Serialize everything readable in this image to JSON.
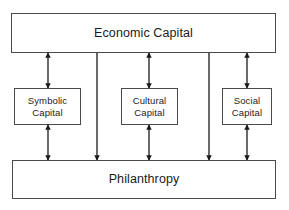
{
  "diagram": {
    "type": "block-flow-diagram",
    "width": 289,
    "height": 210,
    "background_color": "#ffffff",
    "stroke_color": "#4a4a4a",
    "arrow_color": "#1a1a1a",
    "text_color": "#1b1b1b",
    "nodes": {
      "economic_capital": {
        "label": "Economic Capital",
        "role": "top-tier"
      },
      "symbolic_capital": {
        "label": "Symbolic\nCapital",
        "role": "middle-tier"
      },
      "cultural_capital": {
        "label": "Cultural\nCapital",
        "role": "middle-tier"
      },
      "social_capital": {
        "label": "Social\nCapital",
        "role": "middle-tier"
      },
      "philanthropy": {
        "label": "Philanthropy",
        "role": "bottom-tier"
      }
    },
    "connectors": [
      {
        "name": "economic-to-symbolic",
        "from": "economic_capital",
        "to": "symbolic_capital",
        "style": "double-headed",
        "x": 48,
        "y1": 53,
        "y2": 88
      },
      {
        "name": "economic-to-cultural",
        "from": "economic_capital",
        "to": "cultural_capital",
        "style": "double-headed",
        "x": 149,
        "y1": 53,
        "y2": 88
      },
      {
        "name": "economic-to-social",
        "from": "economic_capital",
        "to": "social_capital",
        "style": "double-headed",
        "x": 247,
        "y1": 53,
        "y2": 88
      },
      {
        "name": "symbolic-to-philanthropy",
        "from": "symbolic_capital",
        "to": "philanthropy",
        "style": "double-headed",
        "x": 48,
        "y1": 125,
        "y2": 160
      },
      {
        "name": "cultural-to-philanthropy",
        "from": "cultural_capital",
        "to": "philanthropy",
        "style": "double-headed",
        "x": 149,
        "y1": 125,
        "y2": 160
      },
      {
        "name": "social-to-philanthropy",
        "from": "social_capital",
        "to": "philanthropy",
        "style": "double-headed",
        "x": 247,
        "y1": 125,
        "y2": 160
      },
      {
        "name": "economic-to-philanthropy-left",
        "from": "economic_capital",
        "to": "philanthropy",
        "style": "single-headed-down",
        "x": 97,
        "y1": 53,
        "y2": 160
      },
      {
        "name": "economic-to-philanthropy-right",
        "from": "economic_capital",
        "to": "philanthropy",
        "style": "single-headed-down",
        "x": 209,
        "y1": 53,
        "y2": 160
      }
    ]
  }
}
